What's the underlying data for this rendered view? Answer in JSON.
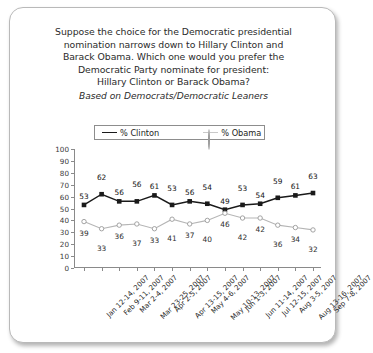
{
  "question": {
    "lines": [
      "Suppose the choice for the Democratic presidential",
      "nomination narrows down to Hillary Clinton and",
      "Barack Obama. Which one would you prefer the",
      "Democratic Party nominate for president:",
      "Hillary Clinton or Barack Obama?"
    ],
    "subtitle": "Based on Democrats/Democratic Leaners"
  },
  "chart_data": {
    "type": "line",
    "subtitle": "Based on Democrats/Democratic Leaners",
    "xlabel": "",
    "ylabel": "",
    "ylim": [
      0,
      100
    ],
    "yticks": [
      0,
      10,
      20,
      30,
      40,
      50,
      60,
      70,
      80,
      90,
      100
    ],
    "grid": false,
    "legend_position": "top-center",
    "categories": [
      "Jan 12-14, 2007",
      "Feb 9-11, 2007",
      "Mar 2-4, 2007",
      "Mar 23-25, 2007",
      "Apr 2-5, 2007",
      "Apr 13-15, 2007",
      "May 4-6, 2007",
      "May 10-13, 2007",
      "Jun 1-3, 2007",
      "Jun 11-14, 2007",
      "Jul 12-15, 2007",
      "Aug 3-5, 2007",
      "Aug 13-16, 2007",
      "Sep 7-8, 2007"
    ],
    "series": [
      {
        "name": "% Clinton",
        "color": "#1a1a1a",
        "marker": "filled-square",
        "values": [
          53,
          62,
          56,
          56,
          61,
          53,
          56,
          54,
          49,
          53,
          54,
          59,
          61,
          63
        ]
      },
      {
        "name": "% Obama",
        "color": "#b5b5b5",
        "marker": "open-circle",
        "values": [
          39,
          33,
          36,
          37,
          33,
          41,
          37,
          40,
          46,
          42,
          42,
          36,
          34,
          32
        ]
      }
    ]
  }
}
